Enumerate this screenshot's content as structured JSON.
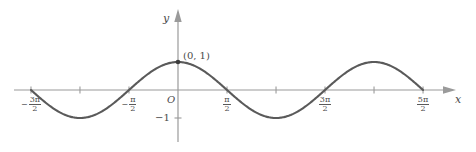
{
  "figure": {
    "kind": "cosine-graph",
    "background_color": "#ffffff",
    "curve_color": "#5a5a5a",
    "axis_color": "#9a9a9a",
    "text_color": "#4a4a4a",
    "axes": {
      "y_axis_label": "y",
      "x_axis_label": "x",
      "origin_label": "O"
    },
    "annotations": [
      {
        "name": "point-0-1",
        "text": "(0, 1)"
      }
    ],
    "y_ticks": [
      {
        "name": "y-tick-neg-one",
        "sign": "−",
        "text": "1"
      }
    ],
    "x_ticks": [
      {
        "name": "x-tick-neg-3pi-over-2",
        "sign": "−",
        "num": "3π",
        "den": "2",
        "value": -4.712,
        "labeled": true
      },
      {
        "name": "x-tick-neg-pi",
        "sign": "",
        "num": "",
        "den": "",
        "value": -3.142,
        "labeled": false
      },
      {
        "name": "x-tick-neg-pi-over-2",
        "sign": "−",
        "num": "π",
        "den": "2",
        "value": -1.571,
        "labeled": true
      },
      {
        "name": "x-tick-zero",
        "sign": "",
        "num": "",
        "den": "",
        "value": 0.0,
        "labeled": false
      },
      {
        "name": "x-tick-pi-over-2",
        "sign": "",
        "num": "π",
        "den": "2",
        "value": 1.571,
        "labeled": true
      },
      {
        "name": "x-tick-pi",
        "sign": "",
        "num": "",
        "den": "",
        "value": 3.142,
        "labeled": false
      },
      {
        "name": "x-tick-3pi-over-2",
        "sign": "",
        "num": "3π",
        "den": "2",
        "value": 4.712,
        "labeled": true
      },
      {
        "name": "x-tick-2pi",
        "sign": "",
        "num": "",
        "den": "",
        "value": 6.283,
        "labeled": false
      },
      {
        "name": "x-tick-5pi-over-2",
        "sign": "",
        "num": "5π",
        "den": "2",
        "value": 7.854,
        "labeled": true
      }
    ]
  },
  "chart_data": {
    "type": "line",
    "title": "",
    "xlabel": "x",
    "ylabel": "y",
    "function": "y = cos(x)",
    "grid": false,
    "legend": "none",
    "xlim": [
      -5.5,
      9.0
    ],
    "ylim": [
      -1.45,
      1.6
    ],
    "xtick_values": [
      -4.712,
      -3.142,
      -1.571,
      0.0,
      1.571,
      3.142,
      4.712,
      6.283,
      7.854
    ],
    "xtick_labels": [
      "-3π/2",
      "",
      "-π/2",
      "",
      "π/2",
      "",
      "3π/2",
      "",
      "5π/2"
    ],
    "ytick_values": [
      -1
    ],
    "ytick_labels": [
      "-1"
    ],
    "domain": [
      -4.712,
      7.854
    ],
    "amplitude": 1,
    "period": 6.283,
    "marked_points": [
      {
        "x": 0,
        "y": 1,
        "label": "(0, 1)"
      }
    ],
    "x": [
      -4.712,
      -4.4,
      -4.0,
      -3.6,
      -3.142,
      -2.8,
      -2.4,
      -2.0,
      -1.571,
      -1.2,
      -0.8,
      -0.4,
      0.0,
      0.4,
      0.8,
      1.2,
      1.571,
      2.0,
      2.4,
      2.8,
      3.142,
      3.6,
      4.0,
      4.4,
      4.712,
      5.2,
      5.6,
      6.0,
      6.283,
      6.8,
      7.2,
      7.6,
      7.854
    ],
    "y": [
      0.0,
      -0.3,
      -0.654,
      -0.897,
      -1.0,
      -0.942,
      -0.737,
      -0.416,
      0.0,
      0.362,
      0.697,
      0.921,
      1.0,
      0.921,
      0.697,
      0.362,
      0.0,
      -0.416,
      -0.737,
      -0.942,
      -1.0,
      -0.897,
      -0.654,
      -0.307,
      0.0,
      0.469,
      0.776,
      0.96,
      1.0,
      0.869,
      0.608,
      0.251,
      0.0
    ]
  }
}
